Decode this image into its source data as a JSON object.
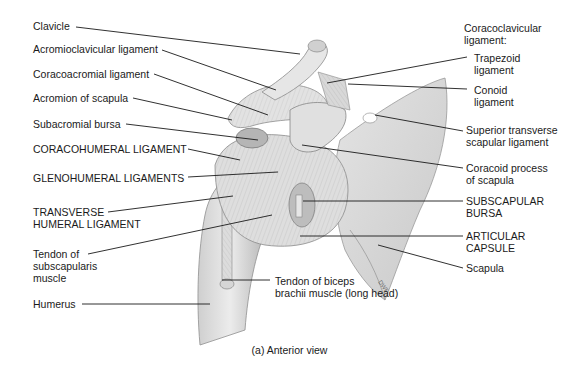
{
  "figure": {
    "caption": "(a) Anterior view",
    "signature": "DWF"
  },
  "labels_left": [
    {
      "id": "clavicle",
      "text": "Clavicle",
      "x": 33,
      "y": 20,
      "line": [
        [
          76,
          27
        ],
        [
          300,
          54
        ]
      ]
    },
    {
      "id": "acromioclavicular",
      "text": "Acromioclavicular ligament",
      "x": 33,
      "y": 43,
      "line": [
        [
          162,
          50
        ],
        [
          276,
          90
        ]
      ]
    },
    {
      "id": "coracoacromial",
      "text": "Coracoacromial ligament",
      "x": 33,
      "y": 68,
      "line": [
        [
          154,
          74
        ],
        [
          268,
          115
        ]
      ]
    },
    {
      "id": "acromion",
      "text": "Acromion of scapula",
      "x": 33,
      "y": 92,
      "line": [
        [
          133,
          98
        ],
        [
          232,
          120
        ]
      ]
    },
    {
      "id": "subacromial_bursa",
      "text": "Subacromial bursa",
      "x": 33,
      "y": 118,
      "line": [
        [
          126,
          124
        ],
        [
          258,
          140
        ]
      ]
    },
    {
      "id": "coracohumeral",
      "text": "CORACOHUMERAL LIGAMENT",
      "x": 33,
      "y": 143,
      "line": [
        [
          188,
          149
        ],
        [
          240,
          160
        ]
      ]
    },
    {
      "id": "glenohumeral",
      "text": "GLENOHUMERAL LIGAMENTS",
      "x": 33,
      "y": 172,
      "line": [
        [
          188,
          177
        ],
        [
          278,
          172
        ]
      ]
    },
    {
      "id": "transverse_humeral",
      "text": "TRANSVERSE\nHUMERAL LIGAMENT",
      "x": 33,
      "y": 209,
      "line": [
        [
          108,
          212
        ],
        [
          233,
          196
        ]
      ]
    },
    {
      "id": "subscapularis_tendon",
      "text": "Tendon of\nsubscapularis\nmuscle",
      "x": 33,
      "y": 251,
      "line": [
        [
          88,
          254
        ],
        [
          272,
          215
        ]
      ]
    },
    {
      "id": "humerus",
      "text": "Humerus",
      "x": 33,
      "y": 298,
      "line": [
        [
          82,
          304
        ],
        [
          210,
          304
        ]
      ]
    }
  ],
  "labels_right": [
    {
      "id": "coracoclavicular",
      "text": "Coracoclavicular\nligament:",
      "x": 464,
      "y": 24,
      "line": null
    },
    {
      "id": "trapezoid",
      "text": "Trapezoid\nligament",
      "x": 474,
      "y": 52,
      "line": [
        [
          467,
          57
        ],
        [
          327,
          83
        ]
      ]
    },
    {
      "id": "conoid",
      "text": "Conoid\nligament",
      "x": 474,
      "y": 84,
      "line": [
        [
          467,
          89
        ],
        [
          348,
          84
        ]
      ]
    },
    {
      "id": "superior_transverse",
      "text": "Superior transverse\nscapular ligament",
      "x": 466,
      "y": 124,
      "line": [
        [
          463,
          131
        ],
        [
          375,
          115
        ]
      ]
    },
    {
      "id": "coracoid",
      "text": "Coracoid process\nof scapula",
      "x": 466,
      "y": 162,
      "line": [
        [
          463,
          168
        ],
        [
          302,
          145
        ]
      ]
    },
    {
      "id": "subscapular_bursa",
      "text": "SUBSCAPULAR\nBURSA",
      "x": 466,
      "y": 196,
      "line": [
        [
          463,
          201
        ],
        [
          303,
          201
        ]
      ]
    },
    {
      "id": "articular_capsule",
      "text": "ARTICULAR\nCAPSULE",
      "x": 466,
      "y": 230,
      "line": [
        [
          463,
          236
        ],
        [
          300,
          236
        ]
      ]
    },
    {
      "id": "scapula",
      "text": "Scapula",
      "x": 466,
      "y": 262,
      "line": [
        [
          463,
          268
        ],
        [
          378,
          245
        ]
      ]
    },
    {
      "id": "biceps_tendon",
      "text": "Tendon of biceps\nbrachii muscle (long head)",
      "x": 275,
      "y": 277,
      "line": [
        [
          270,
          280
        ],
        [
          222,
          280
        ]
      ]
    }
  ]
}
